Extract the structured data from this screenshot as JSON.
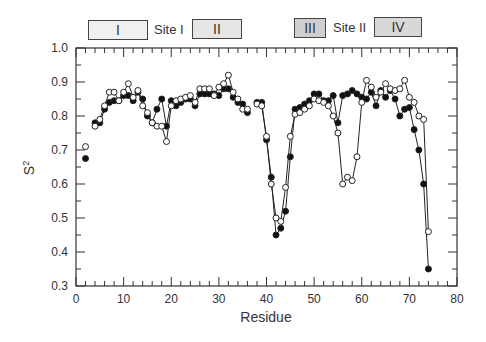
{
  "header": {
    "boxes": [
      {
        "label": "I",
        "x": 88,
        "w": 58
      },
      {
        "label": "II",
        "x": 192,
        "w": 48
      },
      {
        "label": "III",
        "x": 294,
        "w": 30
      },
      {
        "label": "IV",
        "x": 374,
        "w": 46
      }
    ],
    "site_labels": [
      {
        "label": "Site I",
        "x": 154
      },
      {
        "label": "Site II",
        "x": 333
      }
    ]
  },
  "chart_data": {
    "type": "line",
    "title": "",
    "xlabel": "Residue",
    "ylabel": "S²",
    "xlim": [
      0,
      80
    ],
    "ylim": [
      0.3,
      1.0
    ],
    "xticks": [
      0,
      10,
      20,
      30,
      40,
      50,
      60,
      70,
      80
    ],
    "yticks": [
      0.3,
      0.4,
      0.5,
      0.6,
      0.7,
      0.8,
      0.9,
      1.0
    ],
    "grid": false,
    "legend": "none",
    "series": [
      {
        "name": "filled",
        "marker": "filled-circle",
        "points": [
          [
            2,
            0.675
          ],
          [
            4,
            0.78
          ],
          [
            5,
            0.78
          ],
          [
            6,
            0.82
          ],
          [
            7,
            0.84
          ],
          [
            8,
            0.845
          ],
          [
            9,
            0.845
          ],
          [
            10,
            0.86
          ],
          [
            11,
            0.86
          ],
          [
            12,
            0.845
          ],
          [
            13,
            0.87
          ],
          [
            14,
            0.85
          ],
          [
            15,
            0.8
          ],
          [
            16,
            0.78
          ],
          [
            17,
            0.82
          ],
          [
            18,
            0.85
          ],
          [
            19,
            0.77
          ],
          [
            20,
            0.845
          ],
          [
            21,
            0.83
          ],
          [
            22,
            0.84
          ],
          [
            23,
            0.85
          ],
          [
            24,
            0.85
          ],
          [
            25,
            0.83
          ],
          [
            26,
            0.865
          ],
          [
            27,
            0.865
          ],
          [
            28,
            0.865
          ],
          [
            29,
            0.865
          ],
          [
            30,
            0.86
          ],
          [
            31,
            0.88
          ],
          [
            32,
            0.88
          ],
          [
            33,
            0.855
          ],
          [
            34,
            0.84
          ],
          [
            35,
            0.835
          ],
          [
            36,
            0.81
          ],
          [
            38,
            0.84
          ],
          [
            39,
            0.84
          ],
          [
            40,
            0.73
          ],
          [
            41,
            0.62
          ],
          [
            42,
            0.45
          ],
          [
            43,
            0.47
          ],
          [
            44,
            0.52
          ],
          [
            45,
            0.68
          ],
          [
            46,
            0.82
          ],
          [
            47,
            0.825
          ],
          [
            48,
            0.835
          ],
          [
            49,
            0.845
          ],
          [
            50,
            0.865
          ],
          [
            51,
            0.865
          ],
          [
            52,
            0.845
          ],
          [
            53,
            0.845
          ],
          [
            54,
            0.86
          ],
          [
            55,
            0.78
          ],
          [
            56,
            0.86
          ],
          [
            57,
            0.865
          ],
          [
            58,
            0.875
          ],
          [
            59,
            0.865
          ],
          [
            60,
            0.855
          ],
          [
            61,
            0.85
          ],
          [
            62,
            0.87
          ],
          [
            63,
            0.83
          ],
          [
            64,
            0.875
          ],
          [
            65,
            0.855
          ],
          [
            66,
            0.875
          ],
          [
            67,
            0.85
          ],
          [
            68,
            0.8
          ],
          [
            69,
            0.82
          ],
          [
            70,
            0.825
          ],
          [
            71,
            0.76
          ],
          [
            72,
            0.7
          ],
          [
            73,
            0.6
          ],
          [
            74,
            0.35
          ]
        ]
      },
      {
        "name": "open",
        "marker": "open-circle",
        "points": [
          [
            2,
            0.71
          ],
          [
            4,
            0.77
          ],
          [
            5,
            0.79
          ],
          [
            6,
            0.83
          ],
          [
            7,
            0.87
          ],
          [
            8,
            0.87
          ],
          [
            9,
            0.845
          ],
          [
            10,
            0.87
          ],
          [
            11,
            0.895
          ],
          [
            12,
            0.855
          ],
          [
            13,
            0.875
          ],
          [
            14,
            0.83
          ],
          [
            15,
            0.81
          ],
          [
            16,
            0.78
          ],
          [
            17,
            0.77
          ],
          [
            18,
            0.77
          ],
          [
            19,
            0.725
          ],
          [
            20,
            0.83
          ],
          [
            21,
            0.845
          ],
          [
            22,
            0.85
          ],
          [
            23,
            0.855
          ],
          [
            24,
            0.86
          ],
          [
            25,
            0.84
          ],
          [
            26,
            0.88
          ],
          [
            27,
            0.88
          ],
          [
            28,
            0.88
          ],
          [
            29,
            0.86
          ],
          [
            30,
            0.885
          ],
          [
            31,
            0.895
          ],
          [
            32,
            0.92
          ],
          [
            33,
            0.87
          ],
          [
            34,
            0.85
          ],
          [
            35,
            0.82
          ],
          [
            36,
            0.82
          ],
          [
            38,
            0.835
          ],
          [
            39,
            0.83
          ],
          [
            40,
            0.74
          ],
          [
            41,
            0.6
          ],
          [
            42,
            0.5
          ],
          [
            43,
            0.49
          ],
          [
            44,
            0.59
          ],
          [
            45,
            0.74
          ],
          [
            46,
            0.805
          ],
          [
            47,
            0.81
          ],
          [
            48,
            0.82
          ],
          [
            49,
            0.83
          ],
          [
            50,
            0.85
          ],
          [
            51,
            0.845
          ],
          [
            52,
            0.84
          ],
          [
            53,
            0.83
          ],
          [
            54,
            0.8
          ],
          [
            55,
            0.75
          ],
          [
            56,
            0.6
          ],
          [
            57,
            0.62
          ],
          [
            58,
            0.61
          ],
          [
            59,
            0.68
          ],
          [
            60,
            0.84
          ],
          [
            61,
            0.905
          ],
          [
            62,
            0.885
          ],
          [
            63,
            0.855
          ],
          [
            64,
            0.87
          ],
          [
            65,
            0.895
          ],
          [
            66,
            0.88
          ],
          [
            67,
            0.875
          ],
          [
            68,
            0.88
          ],
          [
            69,
            0.905
          ],
          [
            70,
            0.855
          ],
          [
            71,
            0.84
          ],
          [
            72,
            0.8
          ],
          [
            73,
            0.79
          ],
          [
            74,
            0.46
          ]
        ]
      }
    ]
  }
}
